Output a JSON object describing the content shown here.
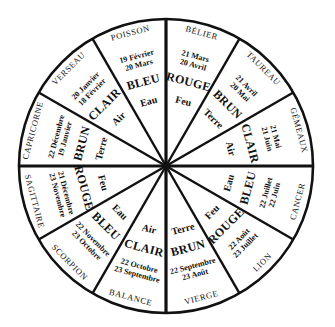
{
  "diagram": {
    "type": "zodiac-wheel",
    "colors": {
      "line": "#111111",
      "background": "#ffffff"
    },
    "sectors": [
      {
        "sign": "BÉLIER",
        "dates": [
          "21 Mars",
          "20 Avril"
        ],
        "color": "ROUGE",
        "element": "Feu"
      },
      {
        "sign": "TAUREAU",
        "dates": [
          "21 Avril",
          "20 Mai"
        ],
        "color": "BRUN",
        "element": "Terre"
      },
      {
        "sign": "GÉMEAUX",
        "dates": [
          "21 Mai",
          "21 Juin"
        ],
        "color": "CLAIR",
        "element": "Air"
      },
      {
        "sign": "CANCER",
        "dates": [
          "22 Juin",
          "22 Juillet"
        ],
        "color": "BLEU",
        "element": "Eau"
      },
      {
        "sign": "LION",
        "dates": [
          "23 Juillet",
          "22 Août"
        ],
        "color": "ROUGE",
        "element": "Feu"
      },
      {
        "sign": "VIERGE",
        "dates": [
          "23 Août",
          "22 Septembre"
        ],
        "color": "BRUN",
        "element": "Terre"
      },
      {
        "sign": "BALANCE",
        "dates": [
          "23 Septembre",
          "22 Octobre"
        ],
        "color": "CLAIR",
        "element": "Air"
      },
      {
        "sign": "SCORPION",
        "dates": [
          "23 Octobre",
          "22 Novembre"
        ],
        "color": "BLEU",
        "element": "Eau"
      },
      {
        "sign": "SAGITTAIRE",
        "dates": [
          "23 Novembre",
          "21 Décembre"
        ],
        "color": "ROUGE",
        "element": "Feu"
      },
      {
        "sign": "CAPRICORNE",
        "dates": [
          "22 Décembre",
          "19 Janvier"
        ],
        "color": "BRUN",
        "element": "Terre"
      },
      {
        "sign": "VERSEAU",
        "dates": [
          "20 Janvier",
          "18 Février"
        ],
        "color": "CLAIR",
        "element": "Air"
      },
      {
        "sign": "POISSON",
        "dates": [
          "19 Février",
          "20 Mars"
        ],
        "color": "BLEU",
        "element": "Eau"
      }
    ]
  }
}
